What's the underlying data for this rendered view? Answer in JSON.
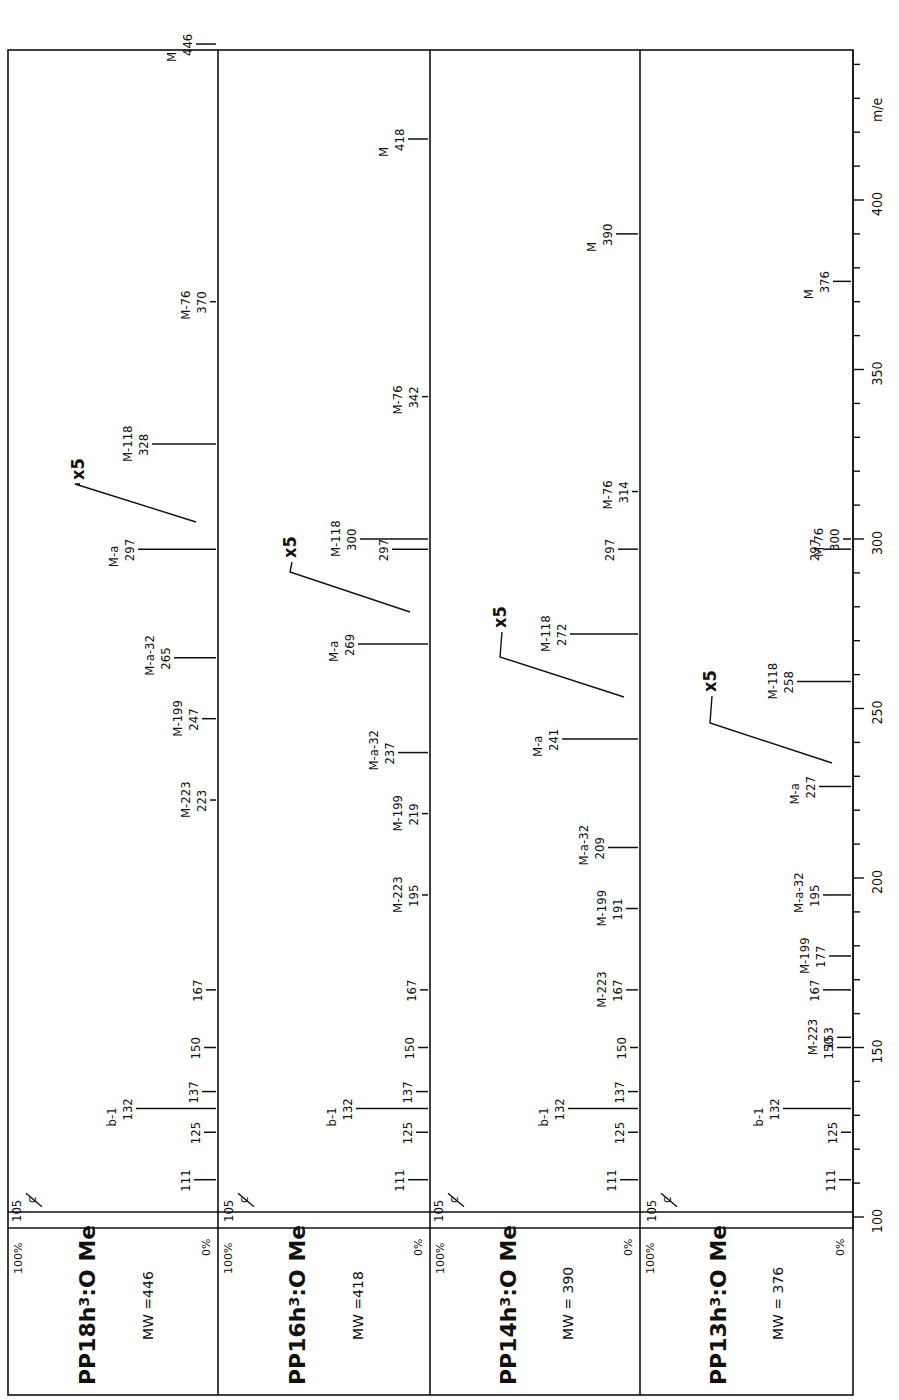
{
  "chart_data": {
    "type": "bar",
    "title": "",
    "orientation": "rotated-90",
    "xlabel": "m/e",
    "ylabel": "relative intensity",
    "xlim": [
      100,
      450
    ],
    "x_ticks": [
      100,
      150,
      200,
      250,
      300,
      350,
      400
    ],
    "intensity_scale": {
      "top": "100%",
      "bottom": "0%"
    },
    "grid": false,
    "panels": [
      {
        "name": "PP18h3:O Me",
        "compound": "PP18h",
        "superscript": "3",
        "suffix": ":O Me",
        "mw_label": "MW =446",
        "mw": 446,
        "scale_note": "x5",
        "peaks": [
          {
            "mz": 105,
            "label": "c",
            "note": "offscale"
          },
          {
            "mz": 111,
            "label": ""
          },
          {
            "mz": 125,
            "label": ""
          },
          {
            "mz": 132,
            "label": "b-1"
          },
          {
            "mz": 137,
            "label": ""
          },
          {
            "mz": 150,
            "label": ""
          },
          {
            "mz": 167,
            "label": ""
          },
          {
            "mz": 223,
            "label": "M-223"
          },
          {
            "mz": 247,
            "label": "M-199"
          },
          {
            "mz": 265,
            "label": "M-a-32"
          },
          {
            "mz": 297,
            "label": "M-a"
          },
          {
            "mz": 328,
            "label": "M-118"
          },
          {
            "mz": 370,
            "label": "M-76"
          },
          {
            "mz": 446,
            "label": "M"
          }
        ]
      },
      {
        "name": "PP16h3:O Me",
        "compound": "PP16h",
        "superscript": "3",
        "suffix": ":O Me",
        "mw_label": "MW =418",
        "mw": 418,
        "scale_note": "x5",
        "peaks": [
          {
            "mz": 105,
            "label": "c",
            "note": "offscale"
          },
          {
            "mz": 111,
            "label": ""
          },
          {
            "mz": 125,
            "label": ""
          },
          {
            "mz": 132,
            "label": "b-1"
          },
          {
            "mz": 137,
            "label": ""
          },
          {
            "mz": 150,
            "label": ""
          },
          {
            "mz": 167,
            "label": ""
          },
          {
            "mz": 195,
            "label": "M-223"
          },
          {
            "mz": 219,
            "label": "M-199"
          },
          {
            "mz": 237,
            "label": "M-a-32"
          },
          {
            "mz": 269,
            "label": "M-a"
          },
          {
            "mz": 297,
            "label": ""
          },
          {
            "mz": 300,
            "label": "M-118"
          },
          {
            "mz": 342,
            "label": "M-76"
          },
          {
            "mz": 418,
            "label": "M"
          }
        ]
      },
      {
        "name": "PP14h3:O Me",
        "compound": "PP14h",
        "superscript": "3",
        "suffix": ":O Me",
        "mw_label": "MW = 390",
        "mw": 390,
        "scale_note": "x5",
        "peaks": [
          {
            "mz": 105,
            "label": "c",
            "note": "offscale"
          },
          {
            "mz": 111,
            "label": ""
          },
          {
            "mz": 125,
            "label": ""
          },
          {
            "mz": 132,
            "label": "b-1"
          },
          {
            "mz": 137,
            "label": ""
          },
          {
            "mz": 150,
            "label": ""
          },
          {
            "mz": 167,
            "label": "M-223"
          },
          {
            "mz": 191,
            "label": "M-199"
          },
          {
            "mz": 209,
            "label": "M-a-32"
          },
          {
            "mz": 241,
            "label": "M-a"
          },
          {
            "mz": 272,
            "label": "M-118"
          },
          {
            "mz": 297,
            "label": ""
          },
          {
            "mz": 314,
            "label": "M-76"
          },
          {
            "mz": 390,
            "label": "M"
          }
        ]
      },
      {
        "name": "PP13h3:O Me",
        "compound": "PP13h",
        "superscript": "3",
        "suffix": ":O Me",
        "mw_label": "MW = 376",
        "mw": 376,
        "scale_note": "x5",
        "peaks": [
          {
            "mz": 105,
            "label": "c",
            "note": "offscale"
          },
          {
            "mz": 111,
            "label": ""
          },
          {
            "mz": 125,
            "label": ""
          },
          {
            "mz": 132,
            "label": "b-1"
          },
          {
            "mz": 150,
            "label": ""
          },
          {
            "mz": 153,
            "label": "M-223"
          },
          {
            "mz": 167,
            "label": ""
          },
          {
            "mz": 177,
            "label": "M-199"
          },
          {
            "mz": 195,
            "label": "M-a-32"
          },
          {
            "mz": 227,
            "label": "M-a"
          },
          {
            "mz": 258,
            "label": "M-118"
          },
          {
            "mz": 297,
            "label": ""
          },
          {
            "mz": 300,
            "label": "M-76"
          },
          {
            "mz": 376,
            "label": "M"
          }
        ]
      }
    ]
  },
  "labels": {
    "axis_title": "m/e",
    "pct_top": "100%",
    "pct_bottom": "0%",
    "x5": "x5",
    "tick_100": "100",
    "tick_150": "150",
    "tick_200": "200",
    "tick_250": "250",
    "tick_300": "300",
    "tick_350": "350",
    "tick_400": "400",
    "p1_name": "PP18h",
    "p2_name": "PP16h",
    "p3_name": "PP14h",
    "p4_name": "PP13h",
    "sup": "3",
    "suffix": ":O Me",
    "p1_mw": "MW =446",
    "p2_mw": "MW =418",
    "p3_mw": "MW = 390",
    "p4_mw": "MW = 376"
  }
}
